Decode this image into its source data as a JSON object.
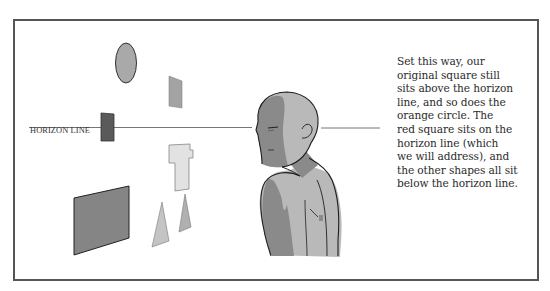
{
  "figure": {
    "horizon_label": "HORIZON LINE",
    "caption_lines": [
      "Set this way, our",
      "original square still",
      "sits above the horizon",
      "line, and so does the",
      "orange circle. The",
      "red square sits on the",
      "horizon line (which",
      "we will address), and",
      "the other shapes all sit",
      "below the horizon line."
    ],
    "shapes": [
      {
        "name": "orange-circle",
        "kind": "ellipse",
        "position": "above horizon"
      },
      {
        "name": "original-square",
        "kind": "quad",
        "position": "above horizon"
      },
      {
        "name": "red-square",
        "kind": "quad",
        "position": "on horizon"
      },
      {
        "name": "cross-shape",
        "kind": "polygon",
        "position": "below horizon"
      },
      {
        "name": "large-rectangle",
        "kind": "quad",
        "position": "below horizon"
      },
      {
        "name": "triangle-left",
        "kind": "triangle",
        "position": "below horizon"
      },
      {
        "name": "triangle-right",
        "kind": "triangle",
        "position": "below horizon"
      }
    ],
    "colors": {
      "frame": "#555555",
      "horizon": "#777777",
      "ellipse": "#a9a9a9",
      "small_square": "#a3a3a3",
      "red_square": "#5a5a5a",
      "cross": "#e2e2e2",
      "large_rect": "#858585",
      "triangle_left": "#c4c4c4",
      "triangle_right": "#b0b0b0",
      "skin_light": "#b9b9b9",
      "skin_dark": "#8a8a8a",
      "outline": "#1e1e1e"
    }
  }
}
